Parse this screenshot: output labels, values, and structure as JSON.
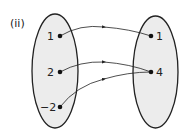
{
  "diagram": {
    "part_label": "(ii)",
    "domain_set": {
      "elements": [
        {
          "label": "1",
          "x": 60,
          "y": 36
        },
        {
          "label": "2",
          "x": 60,
          "y": 72
        },
        {
          "label": "−2",
          "x": 60,
          "y": 107
        }
      ]
    },
    "codomain_set": {
      "elements": [
        {
          "label": "1",
          "x": 151,
          "y": 36
        },
        {
          "label": "4",
          "x": 151,
          "y": 72
        }
      ]
    },
    "mappings": [
      {
        "from": "1",
        "to": "1"
      },
      {
        "from": "2",
        "to": "4"
      },
      {
        "from": "−2",
        "to": "4"
      }
    ],
    "colors": {
      "set_fill": "#ececec",
      "stroke": "#222222"
    }
  }
}
